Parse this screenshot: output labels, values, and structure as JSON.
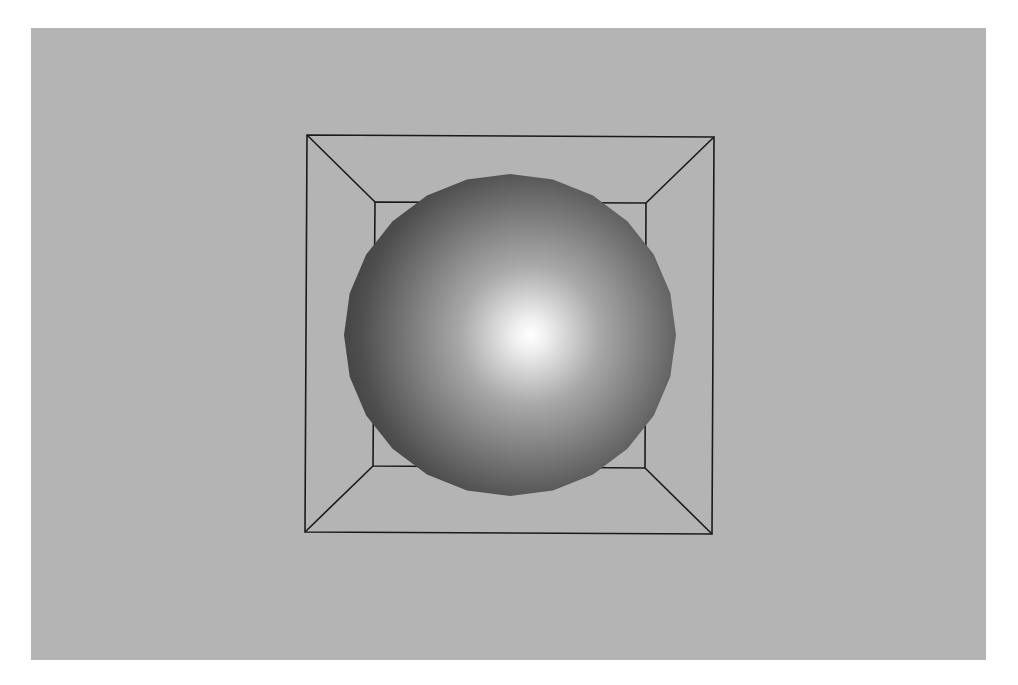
{
  "scene": {
    "canvas": {
      "width": 1018,
      "height": 685,
      "page_color": "#ffffff"
    },
    "viewport": {
      "x": 31,
      "y": 28,
      "width": 955,
      "height": 632,
      "background_color": "#b4b4b4"
    },
    "room_wireframe": {
      "stroke_color": "#1a1a1a",
      "stroke_width": 1.6,
      "outer": {
        "tl": [
          307,
          135
        ],
        "tr": [
          714,
          137
        ],
        "br": [
          712,
          534
        ],
        "bl": [
          305,
          532
        ]
      },
      "inner": {
        "tl": [
          375,
          202
        ],
        "tr": [
          646,
          203
        ],
        "br": [
          645,
          468
        ],
        "bl": [
          373,
          466
        ]
      }
    },
    "sphere": {
      "label": "shaded-sphere",
      "center": [
        510,
        335
      ],
      "radius_x": 166,
      "radius_y": 161,
      "facets": 24,
      "highlight_center": [
        530,
        335
      ],
      "colors": {
        "highlight": "#ffffff",
        "mid": "#a8a8a8",
        "edge": "#4e4e4e"
      }
    }
  }
}
